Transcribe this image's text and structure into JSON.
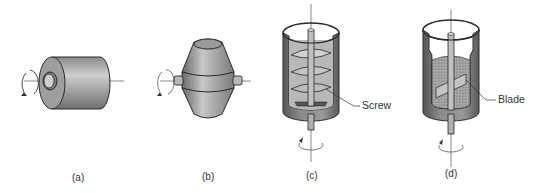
{
  "figure": {
    "panels": [
      {
        "id": "a",
        "caption": "(a)",
        "shape": "horizontal-cylinder-drum"
      },
      {
        "id": "b",
        "caption": "(b)",
        "shape": "double-cone-drum"
      },
      {
        "id": "c",
        "caption": "(c)",
        "shape": "vertical-vessel-with-screw",
        "callout": "Screw"
      },
      {
        "id": "d",
        "caption": "(d)",
        "shape": "vertical-vessel-with-blade",
        "callout": "Blade"
      }
    ],
    "colors": {
      "background": "#ffffff",
      "metal_light": "#d8d8d8",
      "metal_mid": "#a8a8a8",
      "metal_dark": "#6a6a6a",
      "outline": "#2a2a2a",
      "powder": "#9a9a9a"
    }
  }
}
